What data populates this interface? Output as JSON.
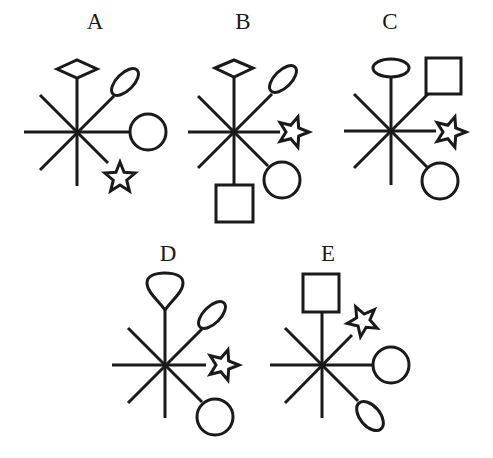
{
  "puzzle": {
    "colors": {
      "ink": "#1a1a1a",
      "background": "#ffffff"
    },
    "figures": [
      {
        "label": "A",
        "center": [
          77,
          132
        ],
        "arms": {
          "up": "diamond",
          "up-right": "ellipse",
          "right": "circle",
          "down-right": "star",
          "down": "none",
          "down-left": "none",
          "left": "none",
          "up-left": "none"
        }
      },
      {
        "label": "B",
        "center": [
          234,
          132
        ],
        "arms": {
          "up": "diamond",
          "up-right": "ellipse",
          "right": "star",
          "down-right": "circle",
          "down": "square",
          "down-left": "none",
          "left": "none",
          "up-left": "none"
        }
      },
      {
        "label": "C",
        "center": [
          391,
          131
        ],
        "arms": {
          "up": "ellipse",
          "up-right": "square",
          "right": "star",
          "down-right": "circle",
          "down": "none",
          "down-left": "none",
          "left": "none",
          "up-left": "none"
        }
      },
      {
        "label": "D",
        "center": [
          165,
          365
        ],
        "arms": {
          "up": "teardrop",
          "up-right": "ellipse",
          "right": "star",
          "down-right": "circle",
          "down": "none",
          "down-left": "none",
          "left": "none",
          "up-left": "none"
        }
      },
      {
        "label": "E",
        "center": [
          322,
          365
        ],
        "arms": {
          "up": "square",
          "up-right": "star",
          "right": "circle",
          "down-right": "ellipse",
          "down": "none",
          "down-left": "none",
          "left": "none",
          "up-left": "none"
        }
      }
    ]
  }
}
